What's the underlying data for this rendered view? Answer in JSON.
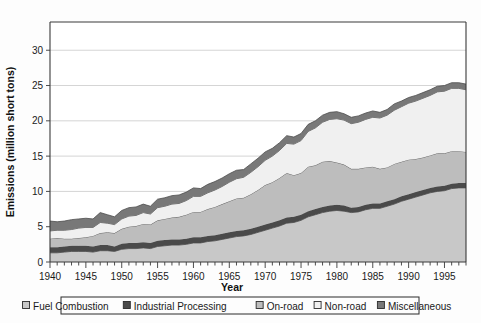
{
  "chart_data": {
    "type": "area",
    "stacked": true,
    "title": "",
    "xlabel": "Year",
    "ylabel": "Emissions (million short tons)",
    "xlim": [
      1940,
      1998
    ],
    "ylim": [
      0,
      34
    ],
    "yticks": [
      0,
      5,
      10,
      15,
      20,
      25,
      30
    ],
    "ytick_labels": [
      "0",
      "5",
      "10",
      "15",
      "20",
      "25",
      "30"
    ],
    "xticks": [
      1940,
      1945,
      1950,
      1955,
      1960,
      1965,
      1970,
      1975,
      1980,
      1985,
      1990,
      1995
    ],
    "xtick_labels": [
      "1940",
      "1945",
      "1950",
      "1955",
      "1960",
      "1965",
      "1970",
      "1975",
      "1980",
      "1985",
      "1990",
      "1995"
    ],
    "xtick_minor_step": 1,
    "grid": "horizontal",
    "legend_position": "below",
    "x": [
      1940,
      1941,
      1942,
      1943,
      1944,
      1945,
      1946,
      1947,
      1948,
      1949,
      1950,
      1951,
      1952,
      1953,
      1954,
      1955,
      1956,
      1957,
      1958,
      1959,
      1960,
      1961,
      1962,
      1963,
      1964,
      1965,
      1966,
      1967,
      1968,
      1969,
      1970,
      1971,
      1972,
      1973,
      1974,
      1975,
      1976,
      1977,
      1978,
      1979,
      1980,
      1981,
      1982,
      1983,
      1984,
      1985,
      1986,
      1987,
      1988,
      1989,
      1990,
      1991,
      1992,
      1993,
      1994,
      1995,
      1996,
      1997,
      1998
    ],
    "series": [
      {
        "name": "Fuel Combustion",
        "color": "#c8c8c8",
        "values": [
          1.3,
          1.3,
          1.4,
          1.5,
          1.5,
          1.5,
          1.4,
          1.6,
          1.6,
          1.5,
          1.8,
          1.9,
          1.9,
          2.0,
          1.9,
          2.2,
          2.3,
          2.4,
          2.4,
          2.5,
          2.7,
          2.7,
          2.9,
          3.0,
          3.2,
          3.4,
          3.6,
          3.7,
          3.9,
          4.2,
          4.5,
          4.8,
          5.1,
          5.5,
          5.6,
          5.9,
          6.4,
          6.7,
          7.0,
          7.2,
          7.3,
          7.2,
          7.0,
          7.1,
          7.4,
          7.6,
          7.6,
          7.9,
          8.2,
          8.6,
          8.9,
          9.2,
          9.5,
          9.8,
          10.0,
          10.1,
          10.4,
          10.5,
          10.5
        ]
      },
      {
        "name": "Industrial Processing",
        "color": "#4a4a4a",
        "values": [
          0.8,
          0.8,
          0.8,
          0.8,
          0.8,
          0.8,
          0.8,
          0.8,
          0.8,
          0.7,
          0.8,
          0.8,
          0.8,
          0.8,
          0.8,
          0.8,
          0.8,
          0.8,
          0.8,
          0.8,
          0.8,
          0.8,
          0.8,
          0.8,
          0.8,
          0.8,
          0.8,
          0.8,
          0.8,
          0.8,
          0.8,
          0.8,
          0.8,
          0.8,
          0.8,
          0.8,
          0.8,
          0.8,
          0.8,
          0.8,
          0.8,
          0.8,
          0.7,
          0.7,
          0.7,
          0.7,
          0.7,
          0.7,
          0.7,
          0.7,
          0.7,
          0.7,
          0.7,
          0.7,
          0.7,
          0.7,
          0.7,
          0.7,
          0.7
        ]
      },
      {
        "name": "On-road",
        "color": "#bdbdbd",
        "values": [
          1.2,
          1.3,
          1.1,
          1.0,
          1.1,
          1.2,
          1.5,
          1.7,
          1.8,
          1.9,
          2.1,
          2.3,
          2.4,
          2.6,
          2.6,
          2.9,
          3.0,
          3.1,
          3.2,
          3.4,
          3.6,
          3.6,
          3.8,
          4.0,
          4.2,
          4.4,
          4.6,
          4.6,
          4.9,
          5.2,
          5.6,
          5.7,
          6.0,
          6.3,
          5.9,
          5.9,
          6.3,
          6.2,
          6.4,
          6.3,
          6.0,
          5.8,
          5.5,
          5.4,
          5.3,
          5.2,
          4.9,
          4.8,
          5.0,
          4.9,
          4.9,
          4.7,
          4.6,
          4.6,
          4.7,
          4.6,
          4.6,
          4.5,
          4.4
        ]
      },
      {
        "name": "Non-road",
        "color": "#f0f0f0",
        "values": [
          1.1,
          1.1,
          1.2,
          1.3,
          1.4,
          1.4,
          1.2,
          1.5,
          1.3,
          1.2,
          1.4,
          1.5,
          1.5,
          1.6,
          1.5,
          1.8,
          1.8,
          1.9,
          1.9,
          2.0,
          2.2,
          2.2,
          2.3,
          2.4,
          2.5,
          2.7,
          2.8,
          2.9,
          3.1,
          3.3,
          3.5,
          3.7,
          3.9,
          4.2,
          4.4,
          4.6,
          5.0,
          5.3,
          5.6,
          5.9,
          6.2,
          6.3,
          6.4,
          6.6,
          6.8,
          7.0,
          7.2,
          7.4,
          7.6,
          7.8,
          8.0,
          8.2,
          8.4,
          8.5,
          8.7,
          8.8,
          8.9,
          8.9,
          8.8
        ]
      },
      {
        "name": "Miscellaneous",
        "color": "#787878",
        "values": [
          1.4,
          1.2,
          1.3,
          1.4,
          1.3,
          1.3,
          1.2,
          1.4,
          1.2,
          1.1,
          1.2,
          1.2,
          1.2,
          1.2,
          1.1,
          1.2,
          1.2,
          1.2,
          1.2,
          1.2,
          1.2,
          1.1,
          1.2,
          1.2,
          1.2,
          1.2,
          1.2,
          1.1,
          1.2,
          1.2,
          1.2,
          1.1,
          1.1,
          1.1,
          1.0,
          1.0,
          1.0,
          1.0,
          1.0,
          1.0,
          1.0,
          0.9,
          0.9,
          0.9,
          0.9,
          0.9,
          0.8,
          0.8,
          0.9,
          0.8,
          0.8,
          0.8,
          0.8,
          0.8,
          0.8,
          0.8,
          0.8,
          0.8,
          0.8
        ]
      }
    ],
    "totals_note": "",
    "legend_entries": [
      "Fuel Combustion",
      "Industrial Processing",
      "On-road",
      "Non-road",
      "Miscellaneous"
    ]
  },
  "axes": {
    "y_title": "Emissions (million short tons)",
    "x_title": "Year"
  }
}
